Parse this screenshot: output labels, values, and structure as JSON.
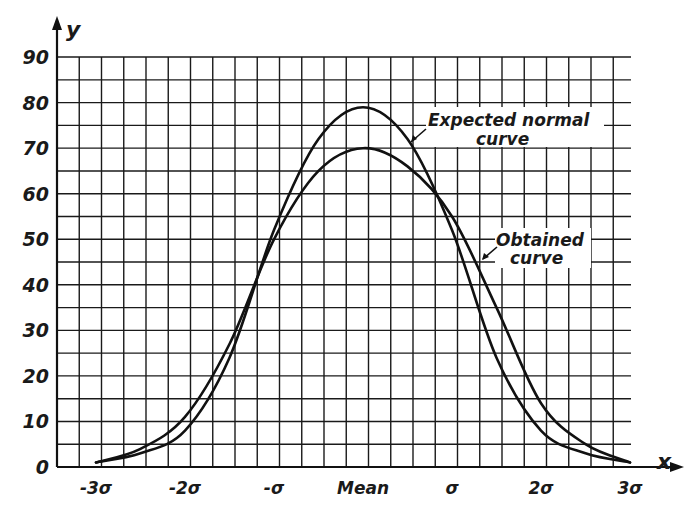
{
  "chart_data": {
    "type": "line",
    "title": "",
    "xlabel": "x",
    "ylabel": "y",
    "ylim": [
      0,
      90
    ],
    "y_ticks": [
      0,
      10,
      20,
      30,
      40,
      50,
      60,
      70,
      80,
      90
    ],
    "y_tick_labels": [
      "0",
      "10",
      "20",
      "30",
      "40",
      "50",
      "60",
      "70",
      "80",
      "90"
    ],
    "x_ticks_sigma": [
      -3,
      -2,
      -1,
      0,
      1,
      2,
      3
    ],
    "x_tick_labels": [
      "-3σ",
      "-2σ",
      "-σ",
      "Mean",
      "σ",
      "2σ",
      "3σ"
    ],
    "grid": true,
    "grid_minor_y_step": 5,
    "legend": "inline annotations with arrows",
    "label_assignment_note": "Labels assigned per the printed leader arrows as read from a low-resolution scan: the 'Expected normal curve' arrow touches the tall narrow curve and the 'Obtained curve' arrow touches the broad flat curve. This is the reverse of the usual convention (an expected normal curve is typically the smoother, broader one), so the assignment is a best reading of the image, not a certainty.",
    "x": [
      -3.0,
      -2.5,
      -2.0,
      -1.5,
      -1.0,
      -0.5,
      0.0,
      0.5,
      1.0,
      1.5,
      2.0,
      2.5,
      3.0
    ],
    "series": [
      {
        "name": "Expected normal curve",
        "shape": "tall, narrow peak",
        "peak": 79,
        "values": [
          1,
          3,
          8,
          24,
          52,
          72,
          79,
          72,
          52,
          24,
          8,
          3,
          1
        ]
      },
      {
        "name": "Obtained curve",
        "shape": "broad, flatter peak",
        "peak": 70,
        "values": [
          1,
          4,
          11,
          27,
          50,
          65,
          70,
          66,
          55,
          35,
          14,
          5,
          1
        ]
      }
    ],
    "annotations": [
      {
        "text": "Expected normal curve",
        "points_to": "Expected normal curve",
        "location": "upper right of peak"
      },
      {
        "text": "Obtained curve",
        "points_to": "Obtained curve",
        "location": "right side, mid height"
      }
    ]
  },
  "labels": {
    "y_axis": "y",
    "x_axis": "x",
    "expected_line1": "Expected normal",
    "expected_line2": "curve",
    "obtained_line1": "Obtained",
    "obtained_line2": "curve"
  }
}
